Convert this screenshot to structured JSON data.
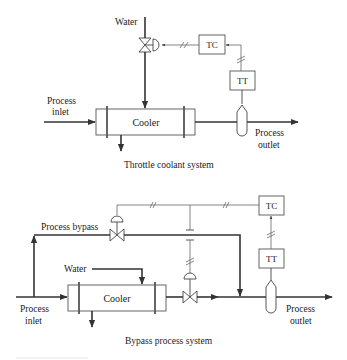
{
  "diagrams": [
    {
      "id": "throttle",
      "caption": "Throttle coolant system",
      "labels": {
        "water": "Water",
        "process_inlet_line1": "Process",
        "process_inlet_line2": "inlet",
        "process_outlet_line1": "Process",
        "process_outlet_line2": "outlet",
        "cooler": "Cooler",
        "tc": "TC",
        "tt": "TT"
      }
    },
    {
      "id": "bypass",
      "caption": "Bypass process system",
      "labels": {
        "water": "Water",
        "process_bypass": "Process bypass",
        "process_inlet_line1": "Process",
        "process_inlet_line2": "inlet",
        "process_outlet_line1": "Process",
        "process_outlet_line2": "outlet",
        "cooler": "Cooler",
        "tc": "TC",
        "tt": "TT"
      }
    }
  ],
  "icons": {
    "control_valve": "bowtie-valve-icon",
    "actuator": "diaphragm-actuator-icon",
    "thermowell": "thermowell-icon",
    "electrical_signal": "double-slash-signal-icon"
  },
  "colors": {
    "line": "#333333",
    "signal": "#666666",
    "text": "#222222",
    "background": "#ffffff"
  }
}
